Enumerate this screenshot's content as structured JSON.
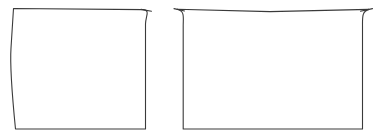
{
  "canvas": {
    "width": 387,
    "height": 140,
    "background_color": "#ffffff",
    "stroke_color": "#3a3a3a",
    "fill_color": "#ffffff",
    "stroke_width": 1.1,
    "title": "Two outlined panel shapes"
  },
  "shapes": [
    {
      "id": "left-panel",
      "label": "Left panel outline",
      "description": "Quadrilateral with slanted bowed left edge, flat top, rounded top-right corner, straight right edge and flat bottom",
      "path": "M 13.5 8.5 L 146.5 10.5 C 152.5 11.5 145.5 14.5 145.5 22.5 L 145.5 129.0 L 15.5 129.0 L 10.5 66.0 Z",
      "outline_path": "M 13.5 8.5 L 143.0 9.6 C 150.5 10.2 145.8 15.5 145.5 24.0 L 145.5 129.0 L 15.5 129.0 C 12.2 96.0 9.8 66.0 11.0 48.0 Z",
      "corners": {
        "top_left": {
          "x": 13.5,
          "y": 8.5,
          "type": "sharp"
        },
        "top_right": {
          "x": 145.5,
          "y": 10.0,
          "type": "rounded"
        },
        "bottom_right": {
          "x": 145.5,
          "y": 129.0,
          "type": "sharp"
        },
        "bottom_left": {
          "x": 15.5,
          "y": 129.0,
          "type": "sharp"
        }
      },
      "hook": "M 141.0 9.4 L 151.5 11.2"
    },
    {
      "id": "right-panel",
      "label": "Right panel outline",
      "description": "Rectangle with both top corners rounded, flat slightly dipped top edge, straight sides and flat bottom",
      "path": "M 176.0 9.0 C 184.5 10.5 183.0 16.0 183.0 25.0 L 183.0 129.0 L 362.5 129.0 L 362.5 25.0 C 362.5 16.0 361.5 11.0 369.5 9.2 Z",
      "outline_path": "M 177.0 9.2 C 185.0 11.0 183.2 17.0 183.2 26.0 L 183.2 129.0 L 362.5 129.0 L 362.5 26.0 C 362.5 16.5 362.0 11.5 369.0 9.4 L 270.0 11.6 Z",
      "corners": {
        "top_left": {
          "x": 183.0,
          "y": 10.0,
          "type": "rounded"
        },
        "top_right": {
          "x": 362.5,
          "y": 10.0,
          "type": "rounded"
        },
        "bottom_right": {
          "x": 362.5,
          "y": 129.0,
          "type": "sharp"
        },
        "bottom_left": {
          "x": 183.0,
          "y": 129.0,
          "type": "sharp"
        }
      },
      "hook_left": "M 174.0 8.6 L 184.5 11.0",
      "hook_right": "M 372.5 8.6 L 360.5 11.2"
    }
  ]
}
